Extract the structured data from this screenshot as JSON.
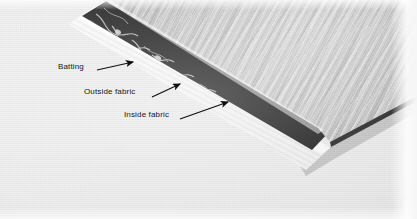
{
  "image": {
    "kind": "instructional-photograph",
    "subject": "quilt-sandwich-layers",
    "width": 417,
    "height": 219,
    "background_color": "#e9e9e9"
  },
  "annotations": [
    {
      "id": "batting",
      "label": "Batting",
      "label_x": 58,
      "label_y": 63,
      "arrow": {
        "x1": 97,
        "y1": 70,
        "x2": 133,
        "y2": 62
      },
      "points_to": "white-batting-layer"
    },
    {
      "id": "outside-fabric",
      "label": "Outside fabric",
      "label_x": 84,
      "label_y": 88,
      "arrow": {
        "x1": 152,
        "y1": 97,
        "x2": 180,
        "y2": 84
      },
      "points_to": "dark-print-fabric-layer"
    },
    {
      "id": "inside-fabric",
      "label": "Inside fabric",
      "label_x": 124,
      "label_y": 111,
      "arrow": {
        "x1": 180,
        "y1": 119,
        "x2": 228,
        "y2": 102
      },
      "points_to": "light-woodgrain-fabric-layer"
    }
  ],
  "layers": [
    {
      "id": "batting",
      "name": "Batting",
      "color": "#f7f7f7",
      "description": "white batting strip"
    },
    {
      "id": "outside_fabric",
      "name": "Outside fabric",
      "color": "#262626",
      "description": "dark fabric with light floral vine print"
    },
    {
      "id": "inside_fabric",
      "name": "Inside fabric",
      "color": "#c2c2c2",
      "description": "light gray streaked woodgrain-style print"
    }
  ],
  "text_color": "#15151a"
}
